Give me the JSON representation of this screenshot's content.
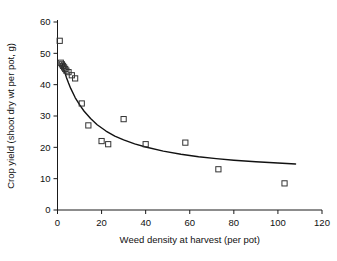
{
  "chart_data": {
    "type": "scatter",
    "title": "",
    "xlabel": "Weed density at harvest (per pot)",
    "ylabel": "Crop yield (shoot dry wt per pot, g)",
    "xlim": [
      0,
      120
    ],
    "ylim": [
      0,
      60
    ],
    "xticks": [
      0,
      20,
      40,
      60,
      80,
      100,
      120
    ],
    "yticks": [
      0,
      10,
      20,
      30,
      40,
      50,
      60
    ],
    "grid": false,
    "legend": null,
    "marker": "open-square",
    "series": [
      {
        "name": "observed",
        "points": [
          [
            1.0,
            54.0
          ],
          [
            1.5,
            47.0
          ],
          [
            2.0,
            46.5
          ],
          [
            2.5,
            46.0
          ],
          [
            3.0,
            45.5
          ],
          [
            3.5,
            45.0
          ],
          [
            4.0,
            44.5
          ],
          [
            5.0,
            44.0
          ],
          [
            6.5,
            43.0
          ],
          [
            8.0,
            42.0
          ],
          [
            11.0,
            34.0
          ],
          [
            14.0,
            27.0
          ],
          [
            20.0,
            22.0
          ],
          [
            23.0,
            21.0
          ],
          [
            30.0,
            29.0
          ],
          [
            40.0,
            21.0
          ],
          [
            58.0,
            21.5
          ],
          [
            73.0,
            13.0
          ],
          [
            103.0,
            8.5
          ]
        ]
      }
    ],
    "fit_curve": {
      "name": "fitted hyperbolic yield-density curve",
      "description": "Crop yield declines hyperbolically with increasing weed density",
      "points": [
        [
          2.0,
          47.0
        ],
        [
          3.0,
          44.5
        ],
        [
          4.0,
          42.4
        ],
        [
          5.0,
          40.5
        ],
        [
          6.0,
          38.8
        ],
        [
          8.0,
          35.9
        ],
        [
          10.0,
          33.6
        ],
        [
          12.0,
          31.6
        ],
        [
          15.0,
          29.2
        ],
        [
          18.0,
          27.2
        ],
        [
          22.0,
          25.2
        ],
        [
          26.0,
          23.6
        ],
        [
          30.0,
          22.4
        ],
        [
          35.0,
          21.1
        ],
        [
          40.0,
          20.1
        ],
        [
          48.0,
          18.8
        ],
        [
          56.0,
          17.8
        ],
        [
          64.0,
          17.0
        ],
        [
          72.0,
          16.4
        ],
        [
          80.0,
          15.9
        ],
        [
          90.0,
          15.4
        ],
        [
          100.0,
          15.0
        ],
        [
          108.0,
          14.7
        ]
      ]
    }
  },
  "axis": {
    "x_tick_labels": [
      "0",
      "20",
      "40",
      "60",
      "80",
      "100",
      "120"
    ],
    "y_tick_labels": [
      "0",
      "10",
      "20",
      "30",
      "40",
      "50",
      "60"
    ],
    "x_title": "Weed density at harvest (per pot)",
    "y_title": "Crop yield (shoot dry wt per pot, g)"
  },
  "colors": {
    "axis": "#1a1a1a",
    "marker_stroke": "#333333",
    "curve": "#111111",
    "background": "#ffffff"
  }
}
